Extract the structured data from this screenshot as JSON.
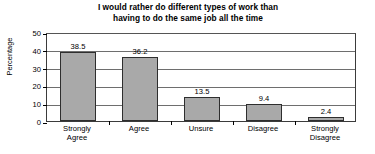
{
  "chart_data": {
    "type": "bar",
    "title": "I would rather do different types of work than\nhaving to do the same job all the time",
    "xlabel": "",
    "ylabel": "Percentage",
    "categories": [
      "Strongly\nAgree",
      "Agree",
      "Unsure",
      "Disagree",
      "Strongly\nDisagree"
    ],
    "values": [
      38.5,
      36.2,
      13.5,
      9.4,
      2.4
    ],
    "value_labels": [
      "38.5",
      "36.2",
      "13.5",
      "9.4",
      "2.4"
    ],
    "ylim": [
      0,
      50
    ],
    "yticks": [
      0,
      10,
      20,
      30,
      40,
      50
    ],
    "ytick_labels": [
      "0",
      "10",
      "20",
      "30",
      "40",
      "50"
    ],
    "grid": true,
    "legend": false,
    "bar_color": "#a9a9a9",
    "bar_border_color": "#2e2e2e",
    "axis_color": "#3b3b3b",
    "gridline_color": "#6e6e6e",
    "background_color": "#ffffff",
    "text_color": "#000000"
  }
}
